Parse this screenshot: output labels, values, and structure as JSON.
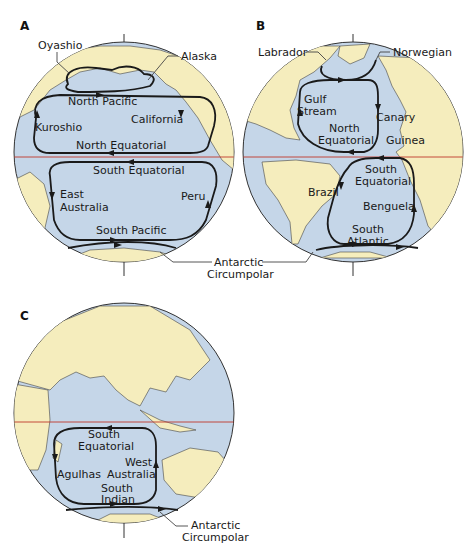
{
  "figure": {
    "panels": [
      {
        "id": "A",
        "label": "A",
        "ocean": "Pacific",
        "currents": {
          "oyashio": "Oyashio",
          "alaska": "Alaska",
          "north_pacific": "North Pacific",
          "kuroshio": "Kuroshio",
          "california": "California",
          "north_equatorial": "North Equatorial",
          "south_equatorial": "South Equatorial",
          "east_australia_1": "East",
          "east_australia_2": "Australia",
          "peru": "Peru",
          "south_pacific": "South Pacific"
        }
      },
      {
        "id": "B",
        "label": "B",
        "ocean": "Atlantic",
        "currents": {
          "labrador": "Labrador",
          "norwegian": "Norwegian",
          "gulf_stream_1": "Gulf",
          "gulf_stream_2": "Stream",
          "north_equatorial_1": "North",
          "north_equatorial_2": "Equatorial",
          "canary": "Canary",
          "guinea": "Guinea",
          "brazil": "Brazil",
          "south_equatorial_1": "South",
          "south_equatorial_2": "Equatorial",
          "benguela": "Benguela",
          "south_atlantic_1": "South",
          "south_atlantic_2": "Atlantic"
        }
      },
      {
        "id": "C",
        "label": "C",
        "ocean": "Indian",
        "currents": {
          "south_equatorial_1": "South",
          "south_equatorial_2": "Equatorial",
          "west_australia_1": "West",
          "west_australia_2": "Australia",
          "agulhas": "Agulhas",
          "south_indian_1": "South",
          "south_indian_2": "Indian",
          "antarctic_1": "Antarctic",
          "antarctic_2": "Circumpolar"
        }
      }
    ],
    "shared_label": {
      "antarctic_1": "Antarctic",
      "antarctic_2": "Circumpolar"
    },
    "colors": {
      "ocean": "#c5d6e8",
      "land": "#f5edbd",
      "equator": "#c0392b",
      "current": "#1a1a1a"
    }
  }
}
